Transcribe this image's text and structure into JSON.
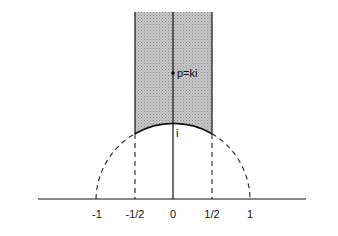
{
  "diagram": {
    "point_label": "p=ki",
    "i_label": "i",
    "axis_ticks": [
      "-1",
      "-1/2",
      "0",
      "1/2",
      "1"
    ],
    "colors": {
      "shade": "#b8b8b8",
      "line": "#111111",
      "background": "#ffffff"
    }
  }
}
